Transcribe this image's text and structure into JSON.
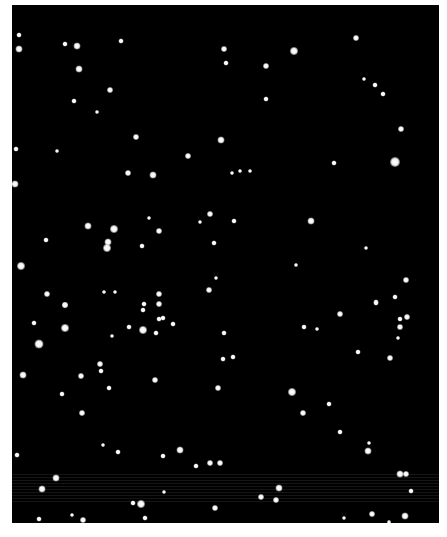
{
  "image": {
    "description": "Night sky star field",
    "background": "#000000",
    "frame": {
      "x": 12,
      "y": 5,
      "width": 427,
      "height": 518
    }
  },
  "stars": [
    {
      "x": 19,
      "y": 35,
      "r": 2.5
    },
    {
      "x": 19,
      "y": 49,
      "r": 3.5
    },
    {
      "x": 65,
      "y": 44,
      "r": 2.5
    },
    {
      "x": 77,
      "y": 46,
      "r": 3.5
    },
    {
      "x": 121,
      "y": 41,
      "r": 2.5
    },
    {
      "x": 79,
      "y": 69,
      "r": 3.5
    },
    {
      "x": 110,
      "y": 90,
      "r": 3
    },
    {
      "x": 74,
      "y": 101,
      "r": 2.5
    },
    {
      "x": 97,
      "y": 112,
      "r": 2
    },
    {
      "x": 136,
      "y": 137,
      "r": 3
    },
    {
      "x": 16,
      "y": 149,
      "r": 2.5
    },
    {
      "x": 57,
      "y": 151,
      "r": 2
    },
    {
      "x": 188,
      "y": 156,
      "r": 3
    },
    {
      "x": 128,
      "y": 173,
      "r": 3
    },
    {
      "x": 153,
      "y": 175,
      "r": 3.5
    },
    {
      "x": 224,
      "y": 49,
      "r": 3
    },
    {
      "x": 226,
      "y": 63,
      "r": 2.5
    },
    {
      "x": 294,
      "y": 51,
      "r": 4
    },
    {
      "x": 266,
      "y": 66,
      "r": 3
    },
    {
      "x": 266,
      "y": 99,
      "r": 2.5
    },
    {
      "x": 356,
      "y": 38,
      "r": 3
    },
    {
      "x": 364,
      "y": 79,
      "r": 2
    },
    {
      "x": 375,
      "y": 85,
      "r": 2.5
    },
    {
      "x": 383,
      "y": 94,
      "r": 2.5
    },
    {
      "x": 401,
      "y": 129,
      "r": 3
    },
    {
      "x": 395,
      "y": 162,
      "r": 5
    },
    {
      "x": 334,
      "y": 163,
      "r": 2.5
    },
    {
      "x": 221,
      "y": 140,
      "r": 3.5
    },
    {
      "x": 232,
      "y": 173,
      "r": 2
    },
    {
      "x": 240,
      "y": 171,
      "r": 2
    },
    {
      "x": 250,
      "y": 171,
      "r": 2
    },
    {
      "x": 15,
      "y": 184,
      "r": 3.5
    },
    {
      "x": 88,
      "y": 226,
      "r": 3.5
    },
    {
      "x": 114,
      "y": 229,
      "r": 4
    },
    {
      "x": 108,
      "y": 242,
      "r": 3.5
    },
    {
      "x": 107,
      "y": 248,
      "r": 4
    },
    {
      "x": 46,
      "y": 240,
      "r": 2.5
    },
    {
      "x": 149,
      "y": 218,
      "r": 2
    },
    {
      "x": 159,
      "y": 231,
      "r": 3
    },
    {
      "x": 142,
      "y": 246,
      "r": 2.5
    },
    {
      "x": 210,
      "y": 214,
      "r": 3
    },
    {
      "x": 200,
      "y": 222,
      "r": 2
    },
    {
      "x": 214,
      "y": 243,
      "r": 2.5
    },
    {
      "x": 21,
      "y": 266,
      "r": 4
    },
    {
      "x": 104,
      "y": 292,
      "r": 2
    },
    {
      "x": 115,
      "y": 292,
      "r": 2
    },
    {
      "x": 159,
      "y": 294,
      "r": 3
    },
    {
      "x": 159,
      "y": 304,
      "r": 3
    },
    {
      "x": 143,
      "y": 310,
      "r": 2.5
    },
    {
      "x": 209,
      "y": 290,
      "r": 3
    },
    {
      "x": 216,
      "y": 278,
      "r": 2
    },
    {
      "x": 47,
      "y": 294,
      "r": 3
    },
    {
      "x": 65,
      "y": 305,
      "r": 3
    },
    {
      "x": 234,
      "y": 221,
      "r": 2.5
    },
    {
      "x": 311,
      "y": 221,
      "r": 3.5
    },
    {
      "x": 366,
      "y": 248,
      "r": 2
    },
    {
      "x": 296,
      "y": 265,
      "r": 2
    },
    {
      "x": 406,
      "y": 280,
      "r": 3
    },
    {
      "x": 395,
      "y": 297,
      "r": 2.5
    },
    {
      "x": 376,
      "y": 302,
      "r": 2.5
    },
    {
      "x": 65,
      "y": 305,
      "r": 3
    },
    {
      "x": 34,
      "y": 323,
      "r": 2.5
    },
    {
      "x": 65,
      "y": 328,
      "r": 4
    },
    {
      "x": 39,
      "y": 344,
      "r": 4.5
    },
    {
      "x": 112,
      "y": 336,
      "r": 2
    },
    {
      "x": 129,
      "y": 327,
      "r": 2.5
    },
    {
      "x": 143,
      "y": 330,
      "r": 4
    },
    {
      "x": 156,
      "y": 333,
      "r": 2.5
    },
    {
      "x": 144,
      "y": 304,
      "r": 2.5
    },
    {
      "x": 159,
      "y": 319,
      "r": 2.5
    },
    {
      "x": 163,
      "y": 318,
      "r": 2.5
    },
    {
      "x": 173,
      "y": 324,
      "r": 2.5
    },
    {
      "x": 23,
      "y": 375,
      "r": 3.5
    },
    {
      "x": 81,
      "y": 376,
      "r": 3
    },
    {
      "x": 100,
      "y": 364,
      "r": 3
    },
    {
      "x": 101,
      "y": 371,
      "r": 2.5
    },
    {
      "x": 109,
      "y": 388,
      "r": 2.5
    },
    {
      "x": 62,
      "y": 394,
      "r": 2.5
    },
    {
      "x": 82,
      "y": 413,
      "r": 3
    },
    {
      "x": 155,
      "y": 380,
      "r": 3
    },
    {
      "x": 223,
      "y": 359,
      "r": 2.5
    },
    {
      "x": 233,
      "y": 357,
      "r": 2.5
    },
    {
      "x": 218,
      "y": 388,
      "r": 3
    },
    {
      "x": 224,
      "y": 333,
      "r": 2.5
    },
    {
      "x": 304,
      "y": 327,
      "r": 2.5
    },
    {
      "x": 317,
      "y": 329,
      "r": 2
    },
    {
      "x": 340,
      "y": 314,
      "r": 3
    },
    {
      "x": 376,
      "y": 303,
      "r": 2.5
    },
    {
      "x": 400,
      "y": 319,
      "r": 2.5
    },
    {
      "x": 407,
      "y": 317,
      "r": 3
    },
    {
      "x": 400,
      "y": 327,
      "r": 3
    },
    {
      "x": 398,
      "y": 338,
      "r": 2
    },
    {
      "x": 358,
      "y": 352,
      "r": 2.5
    },
    {
      "x": 390,
      "y": 358,
      "r": 3
    },
    {
      "x": 292,
      "y": 392,
      "r": 4
    },
    {
      "x": 303,
      "y": 413,
      "r": 3
    },
    {
      "x": 329,
      "y": 404,
      "r": 2.5
    },
    {
      "x": 340,
      "y": 432,
      "r": 2.5
    },
    {
      "x": 369,
      "y": 443,
      "r": 2
    },
    {
      "x": 17,
      "y": 455,
      "r": 2.5
    },
    {
      "x": 103,
      "y": 445,
      "r": 2
    },
    {
      "x": 118,
      "y": 452,
      "r": 2.5
    },
    {
      "x": 163,
      "y": 456,
      "r": 2.5
    },
    {
      "x": 180,
      "y": 450,
      "r": 3.5
    },
    {
      "x": 196,
      "y": 466,
      "r": 2.5
    },
    {
      "x": 210,
      "y": 463,
      "r": 3
    },
    {
      "x": 220,
      "y": 463,
      "r": 3
    },
    {
      "x": 56,
      "y": 478,
      "r": 3.5
    },
    {
      "x": 42,
      "y": 489,
      "r": 3.5
    },
    {
      "x": 164,
      "y": 492,
      "r": 2
    },
    {
      "x": 133,
      "y": 503,
      "r": 2.5
    },
    {
      "x": 141,
      "y": 504,
      "r": 4
    },
    {
      "x": 215,
      "y": 508,
      "r": 3
    },
    {
      "x": 72,
      "y": 515,
      "r": 2
    },
    {
      "x": 39,
      "y": 519,
      "r": 2.5
    },
    {
      "x": 83,
      "y": 520,
      "r": 3
    },
    {
      "x": 145,
      "y": 518,
      "r": 2.5
    },
    {
      "x": 279,
      "y": 488,
      "r": 3.5
    },
    {
      "x": 261,
      "y": 497,
      "r": 3
    },
    {
      "x": 276,
      "y": 500,
      "r": 3
    },
    {
      "x": 368,
      "y": 451,
      "r": 3.5
    },
    {
      "x": 400,
      "y": 474,
      "r": 3.5
    },
    {
      "x": 406,
      "y": 474,
      "r": 3
    },
    {
      "x": 411,
      "y": 491,
      "r": 2.5
    },
    {
      "x": 372,
      "y": 514,
      "r": 3
    },
    {
      "x": 405,
      "y": 516,
      "r": 3.5
    },
    {
      "x": 344,
      "y": 518,
      "r": 2
    },
    {
      "x": 389,
      "y": 522,
      "r": 2
    }
  ],
  "bands": [
    {
      "top": 472,
      "height": 30
    }
  ]
}
